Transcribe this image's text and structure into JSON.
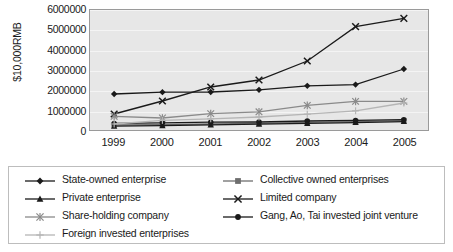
{
  "chart_data": {
    "type": "line",
    "title": "",
    "xlabel": "",
    "ylabel": "$10,000RMB",
    "categories": [
      "1999",
      "2000",
      "2001",
      "2002",
      "2003",
      "2004",
      "2005"
    ],
    "ylim": [
      0,
      6000000
    ],
    "ytick_labels": [
      "6000000",
      "5000000",
      "4000000",
      "3000000",
      "2000000",
      "1000000",
      "0"
    ],
    "ytick_values": [
      6000000,
      5000000,
      4000000,
      3000000,
      2000000,
      1000000,
      0
    ],
    "grid": true,
    "legend_position": "bottom",
    "series": [
      {
        "name": "State-owned enterprise",
        "marker": "diamond",
        "color": "#1a1a1a",
        "values": [
          1800000,
          1890000,
          1900000,
          2010000,
          2210000,
          2270000,
          3050000
        ]
      },
      {
        "name": "Collective owned enterprises",
        "marker": "square",
        "color": "#6e6e6e",
        "values": [
          250000,
          265000,
          300000,
          330000,
          380000,
          420000,
          470000
        ]
      },
      {
        "name": "Private enterprise",
        "marker": "triangle",
        "color": "#1a1a1a",
        "values": [
          190000,
          215000,
          255000,
          290000,
          330000,
          370000,
          420000
        ]
      },
      {
        "name": "Limited company",
        "marker": "x",
        "color": "#1a1a1a",
        "values": [
          800000,
          1450000,
          2150000,
          2500000,
          3450000,
          5170000,
          5580000
        ]
      },
      {
        "name": "Share-holding company",
        "marker": "asterisk",
        "color": "#8a8a8a",
        "values": [
          680000,
          600000,
          820000,
          910000,
          1230000,
          1430000,
          1430000
        ]
      },
      {
        "name": "Gang, Ao, Tai invested joint venture",
        "marker": "circle",
        "color": "#1a1a1a",
        "values": [
          330000,
          360000,
          390000,
          400000,
          450000,
          480000,
          520000
        ]
      },
      {
        "name": "Foreign invested enterprises",
        "marker": "plus",
        "color": "#b5b5b5",
        "values": [
          300000,
          480000,
          560000,
          650000,
          790000,
          960000,
          1350000
        ]
      }
    ]
  },
  "legend": {
    "items": [
      {
        "label": "State-owned enterprise"
      },
      {
        "label": "Collective owned enterprises"
      },
      {
        "label": "Private enterprise"
      },
      {
        "label": "Limited company"
      },
      {
        "label": "Share-holding company"
      },
      {
        "label": "Gang, Ao, Tai invested joint venture"
      },
      {
        "label": "Foreign invested enterprises"
      }
    ]
  }
}
